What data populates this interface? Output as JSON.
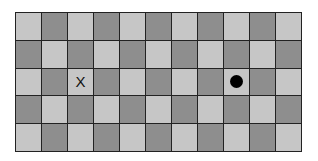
{
  "board": {
    "rows": 5,
    "cols": 11,
    "colors": {
      "light": "#c6c6c6",
      "dark": "#8e8e8e",
      "grid_line": "#222222"
    },
    "pattern": "checkerboard, top-left light"
  },
  "markers": [
    {
      "type": "x",
      "label": "X",
      "row": 2,
      "col": 2
    },
    {
      "type": "dot",
      "label": "",
      "row": 2,
      "col": 8
    }
  ]
}
